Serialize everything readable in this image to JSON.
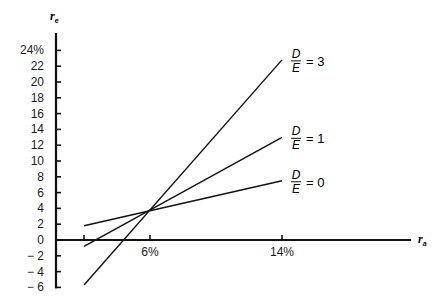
{
  "chart_data": {
    "type": "line",
    "title": "",
    "xlabel": "r_a",
    "ylabel": "r_e",
    "x_ticks": [
      {
        "value": 2,
        "label": ""
      },
      {
        "value": 6,
        "label": "6%"
      },
      {
        "value": 14,
        "label": "14%"
      }
    ],
    "y_ticks": [
      {
        "value": 24,
        "label": "24%"
      },
      {
        "value": 22,
        "label": "22"
      },
      {
        "value": 20,
        "label": "20"
      },
      {
        "value": 18,
        "label": "18"
      },
      {
        "value": 16,
        "label": "16"
      },
      {
        "value": 14,
        "label": "14"
      },
      {
        "value": 12,
        "label": "12"
      },
      {
        "value": 10,
        "label": "10"
      },
      {
        "value": 8,
        "label": "8"
      },
      {
        "value": 6,
        "label": "6"
      },
      {
        "value": 4,
        "label": "4"
      },
      {
        "value": 2,
        "label": "2"
      },
      {
        "value": 0,
        "label": "0"
      },
      {
        "value": -2,
        "label": "− 2"
      },
      {
        "value": -4,
        "label": "− 4"
      },
      {
        "value": -6,
        "label": "− 6"
      }
    ],
    "xlim": [
      0,
      18
    ],
    "ylim": [
      -6,
      26
    ],
    "grid": false,
    "series": [
      {
        "name": "D/E = 3",
        "ratio_label": "3",
        "x": [
          2,
          14
        ],
        "values": [
          -5.7,
          22.8
        ]
      },
      {
        "name": "D/E = 1",
        "ratio_label": "1",
        "x": [
          2,
          14
        ],
        "values": [
          -0.8,
          13.0
        ]
      },
      {
        "name": "D/E = 0",
        "ratio_label": "0",
        "x": [
          2,
          14
        ],
        "values": [
          1.8,
          7.5
        ]
      }
    ],
    "annotations": [
      {
        "text": "intersection",
        "x": 6,
        "y": 3.8
      }
    ],
    "fraction_numerator": "D",
    "fraction_denominator": "E",
    "equals": "="
  },
  "axes": {
    "y_var": "r",
    "y_sub": "e",
    "x_var": "r",
    "x_sub": "a"
  }
}
